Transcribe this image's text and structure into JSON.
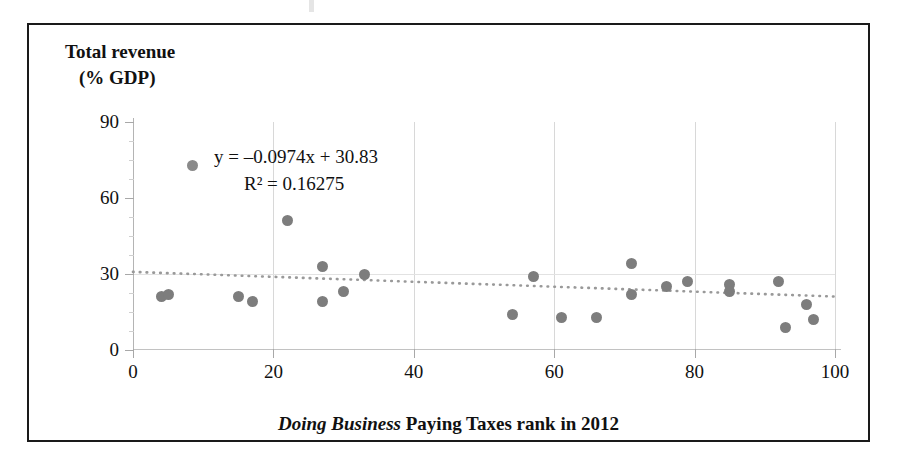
{
  "figure": {
    "y_axis_title_line1": "Total revenue",
    "y_axis_title_line2": "(% GDP)",
    "x_axis_title_italic": "Doing Business",
    "x_axis_title_rest": " Paying Taxes rank in 2012",
    "equation": "y = –0.0974x + 30.83",
    "r_squared": "R² = 0.16275",
    "marker_color": "#7d7d7d",
    "trendline_color": "#999999",
    "frame_color": "#1a1a1a",
    "gridline_color": "#d8d8d8"
  },
  "chart_data": {
    "type": "scatter",
    "title": "",
    "xlabel": "Doing Business Paying Taxes rank in 2012",
    "ylabel": "Total revenue (% GDP)",
    "xlim": [
      0,
      100
    ],
    "ylim": [
      0,
      90
    ],
    "xticks": [
      0,
      20,
      40,
      60,
      80,
      100
    ],
    "yticks": [
      0,
      30,
      60,
      90
    ],
    "y_minor_tick_step": 7.5,
    "grid": "vertical-major",
    "legend": "none",
    "annotations": [
      "y = –0.0974x + 30.83",
      "R² = 0.16275"
    ],
    "trendline": {
      "type": "linear-dotted",
      "slope": -0.0974,
      "intercept": 30.83,
      "r_squared": 0.16275,
      "x_start": 0,
      "x_end": 100
    },
    "points": [
      {
        "x": 4,
        "y": 21
      },
      {
        "x": 5,
        "y": 22
      },
      {
        "x": 15,
        "y": 21
      },
      {
        "x": 17,
        "y": 19
      },
      {
        "x": 22,
        "y": 51
      },
      {
        "x": 27,
        "y": 33
      },
      {
        "x": 27,
        "y": 19
      },
      {
        "x": 30,
        "y": 23
      },
      {
        "x": 33,
        "y": 30
      },
      {
        "x": 54,
        "y": 14
      },
      {
        "x": 57,
        "y": 29
      },
      {
        "x": 61,
        "y": 13
      },
      {
        "x": 66,
        "y": 13
      },
      {
        "x": 71,
        "y": 34
      },
      {
        "x": 71,
        "y": 22
      },
      {
        "x": 76,
        "y": 25
      },
      {
        "x": 79,
        "y": 27
      },
      {
        "x": 85,
        "y": 26
      },
      {
        "x": 85,
        "y": 23
      },
      {
        "x": 92,
        "y": 27
      },
      {
        "x": 93,
        "y": 9
      },
      {
        "x": 96,
        "y": 18
      },
      {
        "x": 97,
        "y": 12
      }
    ]
  }
}
